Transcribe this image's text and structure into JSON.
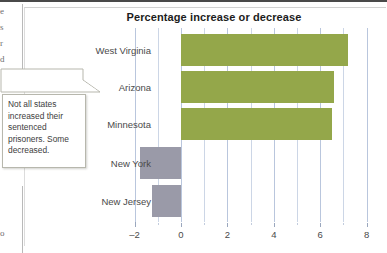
{
  "chart_data": {
    "type": "bar",
    "orientation": "horizontal",
    "title": "Percentage increase or decrease",
    "xlabel": "",
    "ylabel": "",
    "categories": [
      "West Virginia",
      "Arizona",
      "Minnesota",
      "New York",
      "New Jersey"
    ],
    "values": [
      7.2,
      6.6,
      6.5,
      -1.75,
      -1.25
    ],
    "xlim": [
      -2,
      8
    ],
    "xticks": [
      -2,
      0,
      2,
      4,
      6,
      8
    ],
    "xtick_labels": [
      "-2",
      "0",
      "2",
      "4",
      "6",
      "8"
    ],
    "minor_gridlines": [
      -1,
      1,
      3,
      5,
      7
    ],
    "grid": true,
    "legend": "none",
    "colors": {
      "positive_bar": "#94a74a",
      "negative_bar": "#9a9aa8",
      "gridline": "#b9c6dd",
      "title_text": "#1c1c1c",
      "label_text": "#4a4a4a"
    }
  },
  "callout": {
    "text": "Not all states increased their sentenced prisoners. Some decreased."
  },
  "page_fragments": {
    "left_column_clipped": [
      "e",
      "s",
      "r",
      "d"
    ],
    "bottom_left_clipped": "o"
  }
}
